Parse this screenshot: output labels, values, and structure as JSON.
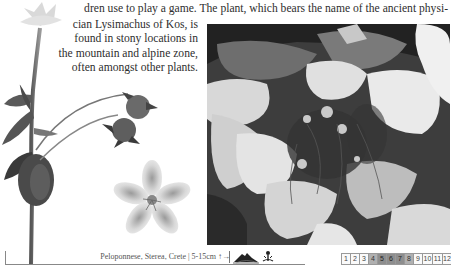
{
  "text": {
    "line1": "dren use to play a game. The plant, which bears the name of the ancient physi-",
    "lines": [
      "cian Lysimachus of Kos, is",
      "found in stony locations in",
      "the mountain and alpine zone,",
      "often amongst other plants."
    ]
  },
  "illustration": {
    "subject": "Lysimachia plant with buds and five-petaled flower",
    "photo_subject": "Plant growing among pale limestone rocks"
  },
  "footer": {
    "distribution": "Peloponnese, Sterea, Crete | 5-15cm",
    "growth_arrows": "↑→",
    "habitat_icons": [
      "mountain-icon",
      "flower-icon"
    ],
    "months": [
      {
        "label": "1",
        "state": "off"
      },
      {
        "label": "2",
        "state": "off"
      },
      {
        "label": "3",
        "state": "off"
      },
      {
        "label": "4",
        "state": "on"
      },
      {
        "label": "5",
        "state": "dark"
      },
      {
        "label": "6",
        "state": "dark"
      },
      {
        "label": "7",
        "state": "dark"
      },
      {
        "label": "8",
        "state": "on"
      },
      {
        "label": "9",
        "state": "off"
      },
      {
        "label": "10",
        "state": "off"
      },
      {
        "label": "11",
        "state": "off"
      },
      {
        "label": "12",
        "state": "off"
      }
    ]
  },
  "colors": {
    "text": "#2e2e2e",
    "month_active": "#b0b0b0",
    "month_peak": "#8e8e8e"
  }
}
